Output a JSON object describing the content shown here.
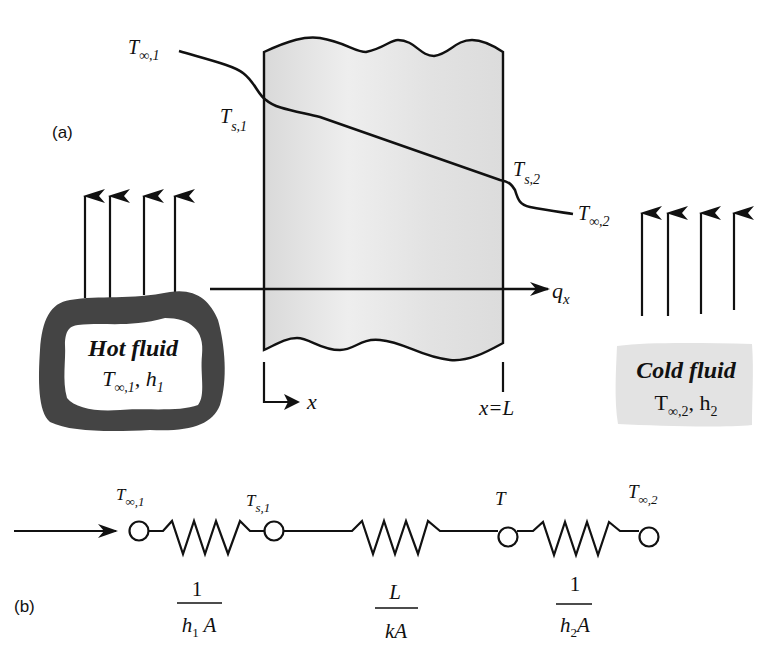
{
  "panel_a": {
    "label": "(a)",
    "profile_labels": {
      "t_inf1": {
        "base": "T",
        "sub": "∞,1"
      },
      "ts1": {
        "base": "T",
        "sub": "s,1"
      },
      "ts2": {
        "base": "T",
        "sub": "s,2"
      },
      "t_inf2": {
        "base": "T",
        "sub": "∞,2"
      }
    },
    "heat_flux": {
      "base": "q",
      "sub": "x"
    },
    "axis": {
      "x_label": "x",
      "x_end_label": "x=L"
    },
    "hot_fluid": {
      "title": "Hot fluid",
      "temp": {
        "base": "T",
        "sub": "∞,1"
      },
      "sep": ", ",
      "coef": {
        "base": "h",
        "sub": "1"
      }
    },
    "cold_fluid": {
      "title": "Cold fluid",
      "temp": {
        "base": "T",
        "sub": "∞,2"
      },
      "sep": ", ",
      "coef": {
        "base": "h",
        "sub": "2"
      }
    }
  },
  "panel_b": {
    "label": "(b)",
    "nodes": [
      {
        "base": "T",
        "sub": "∞,1"
      },
      {
        "base": "T",
        "sub": "s,1"
      },
      {
        "base": "T",
        "sub": ""
      },
      {
        "base": "T",
        "sub": "∞,2"
      }
    ],
    "resistors": [
      {
        "num": "1",
        "den_base": "h",
        "den_sub": "1",
        "den_tail": " A"
      },
      {
        "num": "L",
        "den_base": "kA",
        "den_sub": "",
        "den_tail": ""
      },
      {
        "num": "1",
        "den_base": "h",
        "den_sub": "2",
        "den_tail": "A"
      }
    ]
  },
  "colors": {
    "wall_fill": "#e6e6e6",
    "hot_fluid_border": "#444444",
    "cold_fluid_fill": "#e3e3e3",
    "stroke": "#111111"
  }
}
